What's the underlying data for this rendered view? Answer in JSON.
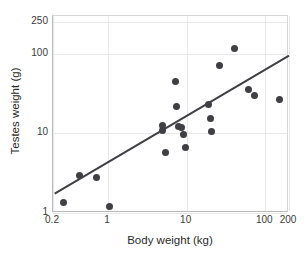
{
  "chart_data": {
    "type": "scatter",
    "title": "",
    "xlabel": "Body weight (kg)",
    "ylabel": "Testes weight (g)",
    "xscale": "log",
    "yscale": "log",
    "xlim": [
      0.2,
      200
    ],
    "ylim": [
      1,
      300
    ],
    "xticks": [
      0.2,
      1,
      10,
      100,
      200
    ],
    "xticklabels": [
      "0.2",
      "1",
      "10",
      "100",
      "200"
    ],
    "yticks": [
      1,
      10,
      100,
      250
    ],
    "yticklabels": [
      "1",
      "10",
      "100",
      "250"
    ],
    "grid": true,
    "legend": null,
    "point_color": "#3f3f44",
    "line_color": "#3f3f44",
    "points": [
      {
        "x": 0.27,
        "y": 1.35
      },
      {
        "x": 0.44,
        "y": 3.0
      },
      {
        "x": 0.72,
        "y": 2.8
      },
      {
        "x": 1.05,
        "y": 1.2
      },
      {
        "x": 4.9,
        "y": 12.5
      },
      {
        "x": 5.0,
        "y": 11.0
      },
      {
        "x": 5.4,
        "y": 5.8
      },
      {
        "x": 7.2,
        "y": 45.0
      },
      {
        "x": 7.4,
        "y": 22.0
      },
      {
        "x": 7.8,
        "y": 12.2
      },
      {
        "x": 8.6,
        "y": 11.8
      },
      {
        "x": 9.2,
        "y": 9.8
      },
      {
        "x": 9.6,
        "y": 6.6
      },
      {
        "x": 19.0,
        "y": 23.0
      },
      {
        "x": 20.0,
        "y": 15.5
      },
      {
        "x": 20.5,
        "y": 10.5
      },
      {
        "x": 26.0,
        "y": 72.0
      },
      {
        "x": 41.0,
        "y": 118.0
      },
      {
        "x": 62.0,
        "y": 36.0
      },
      {
        "x": 72.0,
        "y": 30.0
      },
      {
        "x": 152.0,
        "y": 27.0
      }
    ],
    "trendline": {
      "type": "linear-fit-loglog",
      "x_start": 0.21,
      "y_start": 1.75,
      "x_end": 200.0,
      "y_end": 95.0
    }
  }
}
